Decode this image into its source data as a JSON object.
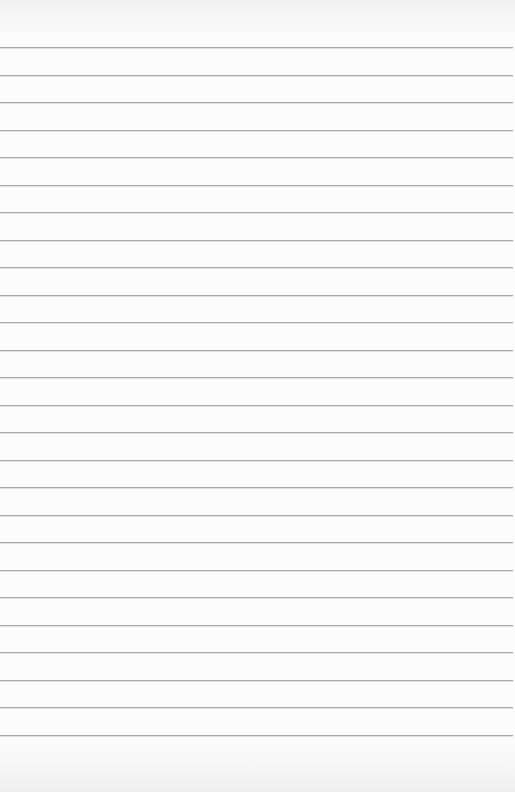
{
  "document": {
    "type": "blank lined paper",
    "text_content": "",
    "paper_color": "#fcfcfc",
    "rule_color": "#a9a9a9",
    "rule_count": 26,
    "first_rule_y": 47,
    "rule_spacing": 27.5,
    "rule_length": 513
  }
}
